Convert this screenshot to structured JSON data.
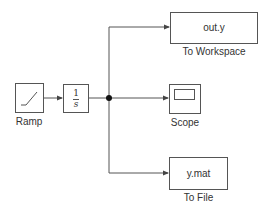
{
  "diagram": {
    "blocks": {
      "ramp": {
        "label": "Ramp",
        "icon": "ramp-icon"
      },
      "integrator": {
        "numerator": "1",
        "denominator": "s"
      },
      "to_workspace": {
        "content": "out.y",
        "label": "To Workspace"
      },
      "scope": {
        "label": "Scope",
        "icon": "scope-screen-icon"
      },
      "to_file": {
        "content": "y.mat",
        "label": "To File"
      }
    },
    "colors": {
      "line": "#555555",
      "text": "#333333",
      "junction": "#111111"
    }
  }
}
